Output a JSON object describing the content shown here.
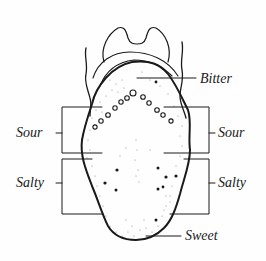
{
  "diagram": {
    "type": "tongue-taste-map",
    "colors": {
      "ink": "#1a1a1a",
      "background": "#fefefe"
    },
    "labels": {
      "bitter": "Bitter",
      "sour_left": "Sour",
      "sour_right": "Sour",
      "salty_left": "Salty",
      "salty_right": "Salty",
      "sweet": "Sweet"
    }
  }
}
